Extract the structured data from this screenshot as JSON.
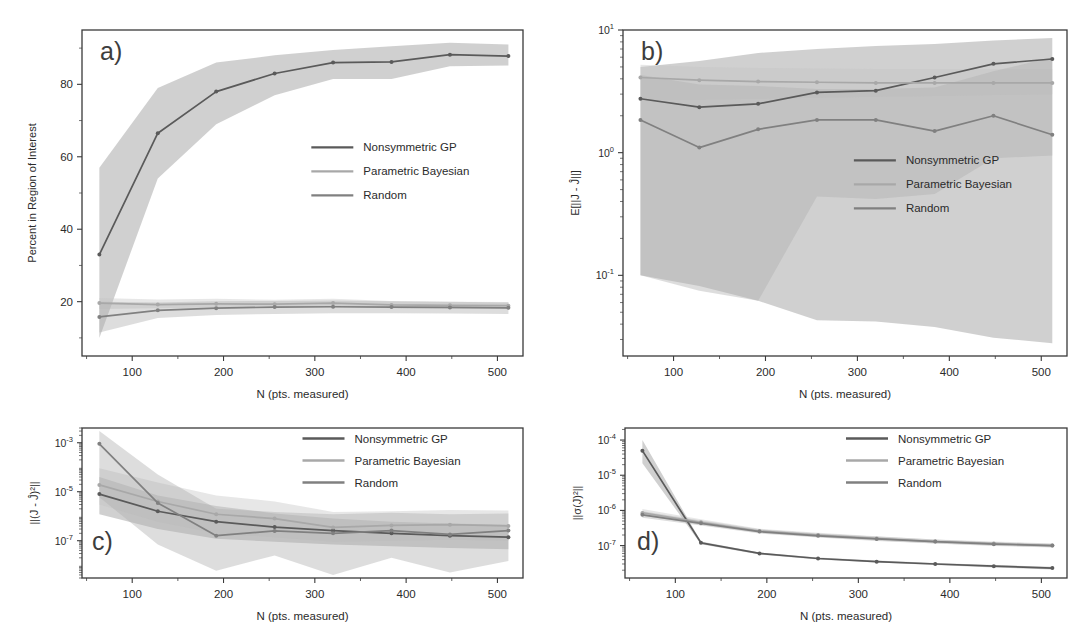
{
  "figure": {
    "xlabel": "N (pts. measured)",
    "series_names": [
      "Nonsymmetric GP",
      "Parametric Bayesian",
      "Random"
    ],
    "colors": {
      "nonsymmetric_gp": "#5a5a5a",
      "parametric_bayesian": "#a8a8a8",
      "random": "#808080",
      "band_gp": "#8f8f8f",
      "band_pb": "#c4c4c4",
      "band_rand": "#adadad",
      "axis": "#3a3a3a",
      "text": "#2b2b2b"
    }
  },
  "chart_data": [
    {
      "id": "a",
      "panel_label": "a)",
      "type": "line",
      "title": "",
      "xlabel": "N (pts. measured)",
      "ylabel": "Percent in Region of Interest",
      "xscale": "linear",
      "yscale": "linear",
      "xlim": [
        45,
        528
      ],
      "ylim": [
        5,
        95
      ],
      "xticks": [
        100,
        200,
        300,
        400,
        500
      ],
      "yticks": [
        20,
        40,
        60,
        80
      ],
      "grid": false,
      "legend_position": "center-right",
      "x": [
        64,
        128,
        192,
        256,
        320,
        384,
        448,
        512
      ],
      "series": [
        {
          "name": "Nonsymmetric GP",
          "values": [
            33.0,
            66.5,
            78.0,
            83.0,
            86.0,
            86.2,
            88.2,
            87.8
          ],
          "band_low": [
            10.0,
            54.0,
            69.0,
            77.0,
            81.5,
            81.5,
            85.0,
            85.2
          ],
          "band_high": [
            57.0,
            79.0,
            86.0,
            88.0,
            89.5,
            90.5,
            91.5,
            91.0
          ]
        },
        {
          "name": "Parametric Bayesian",
          "values": [
            19.6,
            19.2,
            19.4,
            19.3,
            19.6,
            19.1,
            19.0,
            18.9
          ],
          "band_low": [
            18.0,
            18.2,
            18.4,
            18.4,
            18.5,
            18.2,
            18.0,
            18.0
          ],
          "band_high": [
            21.0,
            20.6,
            20.8,
            20.5,
            20.8,
            20.2,
            20.0,
            19.9
          ]
        },
        {
          "name": "Random",
          "values": [
            15.8,
            17.6,
            18.2,
            18.5,
            18.6,
            18.5,
            18.4,
            18.3
          ],
          "band_low": [
            11.5,
            15.5,
            16.3,
            16.6,
            16.8,
            16.8,
            16.7,
            16.6
          ],
          "band_high": [
            20.0,
            19.8,
            20.1,
            20.2,
            20.3,
            20.1,
            20.0,
            19.8
          ]
        }
      ]
    },
    {
      "id": "b",
      "panel_label": "b)",
      "type": "line",
      "title": "",
      "xlabel": "N (pts. measured)",
      "ylabel": "E[||J - Ĵ||]",
      "xscale": "linear",
      "yscale": "log",
      "xlim": [
        45,
        528
      ],
      "ylim": [
        0.022,
        10
      ],
      "xticks": [
        100,
        200,
        300,
        400,
        500
      ],
      "yticks": [
        0.1,
        1,
        10
      ],
      "ytick_labels": [
        "10^-1",
        "10^0",
        "10^1"
      ],
      "grid": false,
      "legend_position": "center-right",
      "x": [
        64,
        128,
        192,
        256,
        320,
        384,
        448,
        512
      ],
      "series": [
        {
          "name": "Nonsymmetric GP",
          "values": [
            2.75,
            2.35,
            2.5,
            3.1,
            3.2,
            4.1,
            5.3,
            5.8
          ],
          "band_low": [
            0.1,
            0.082,
            0.062,
            0.043,
            0.042,
            0.038,
            0.031,
            0.028
          ],
          "band_high": [
            5.0,
            5.6,
            6.5,
            7.0,
            7.4,
            7.7,
            8.2,
            8.6
          ]
        },
        {
          "name": "Parametric Bayesian",
          "values": [
            4.1,
            3.9,
            3.8,
            3.75,
            3.7,
            3.7,
            3.7,
            3.7
          ],
          "band_low": [
            2.7,
            2.7,
            2.75,
            2.8,
            2.85,
            2.9,
            2.95,
            3.0
          ],
          "band_high": [
            5.2,
            5.0,
            4.9,
            4.85,
            4.8,
            4.8,
            4.8,
            4.8
          ]
        },
        {
          "name": "Random",
          "values": [
            1.85,
            1.1,
            1.55,
            1.85,
            1.85,
            1.5,
            2.0,
            1.4
          ],
          "band_low": [
            0.1,
            0.075,
            0.062,
            0.44,
            0.42,
            0.46,
            0.9,
            0.95
          ],
          "band_high": [
            4.3,
            3.6,
            3.5,
            3.3,
            3.3,
            3.4,
            4.6,
            6.0
          ]
        }
      ]
    },
    {
      "id": "c",
      "panel_label": "c)",
      "type": "line",
      "title": "",
      "xlabel": "N (pts. measured)",
      "ylabel": "||(J - Ĵ)²||",
      "xscale": "linear",
      "yscale": "log",
      "xlim": [
        45,
        528
      ],
      "ylim": [
        3e-09,
        0.004
      ],
      "xticks": [
        100,
        200,
        300,
        400,
        500
      ],
      "yticks": [
        0.001,
        1e-05,
        1e-07
      ],
      "ytick_labels": [
        "10^-3",
        "10^-5",
        "10^-7"
      ],
      "grid": false,
      "legend_position": "top-right",
      "x": [
        64,
        128,
        192,
        256,
        320,
        384,
        448,
        512
      ],
      "series": [
        {
          "name": "Nonsymmetric GP",
          "values": [
            8e-06,
            1.6e-06,
            6e-07,
            3.6e-07,
            2.6e-07,
            2e-07,
            1.6e-07,
            1.4e-07
          ],
          "band_low": [
            1.2e-06,
            3e-07,
            1.2e-07,
            9e-08,
            7e-08,
            6e-08,
            5e-08,
            4.5e-08
          ],
          "band_high": [
            4e-05,
            7e-06,
            2.6e-06,
            1.3e-06,
            8e-07,
            6e-07,
            5e-07,
            4.5e-07
          ]
        },
        {
          "name": "Parametric Bayesian",
          "values": [
            1.9e-05,
            4e-06,
            1.2e-06,
            8e-07,
            3.5e-07,
            4.2e-07,
            4.5e-07,
            4e-07
          ],
          "band_low": [
            3e-06,
            6e-07,
            2e-07,
            1.4e-07,
            9e-08,
            1e-07,
            1.1e-07,
            1e-07
          ],
          "band_high": [
            9e-05,
            2.4e-05,
            7e-06,
            4e-06,
            1.5e-06,
            1.6e-06,
            1.8e-06,
            1.7e-06
          ]
        },
        {
          "name": "Random",
          "values": [
            0.0009,
            3.5e-06,
            1.6e-07,
            2.5e-07,
            2e-07,
            2.6e-07,
            1.8e-07,
            2.6e-07
          ],
          "band_low": [
            6e-06,
            7e-08,
            6e-09,
            2.5e-08,
            4e-09,
            2e-08,
            5e-09,
            1.5e-08
          ],
          "band_high": [
            0.003,
            5e-05,
            2e-06,
            1.5e-06,
            1.2e-06,
            1.4e-06,
            1.2e-06,
            1.3e-06
          ]
        }
      ]
    },
    {
      "id": "d",
      "panel_label": "d)",
      "type": "line",
      "title": "",
      "xlabel": "N (pts. measured)",
      "ylabel": "||σ(J)²||",
      "xscale": "linear",
      "yscale": "log",
      "xlim": [
        45,
        528
      ],
      "ylim": [
        1.2e-08,
        0.00022
      ],
      "xticks": [
        100,
        200,
        300,
        400,
        500
      ],
      "yticks": [
        0.0001,
        1e-05,
        1e-06,
        1e-07
      ],
      "ytick_labels": [
        "10^-4",
        "10^-5",
        "10^-6",
        "10^-7"
      ],
      "grid": false,
      "legend_position": "top-right",
      "x": [
        64,
        128,
        192,
        256,
        320,
        384,
        448,
        512
      ],
      "series": [
        {
          "name": "Nonsymmetric GP",
          "values": [
            5e-05,
            1.2e-07,
            6e-08,
            4.3e-08,
            3.5e-08,
            3e-08,
            2.6e-08,
            2.3e-08
          ],
          "band_low": [
            2.2e-05,
            1.1e-07,
            5.6e-08,
            4e-08,
            3.3e-08,
            2.8e-08,
            2.4e-08,
            2.1e-08
          ],
          "band_high": [
            0.0001,
            1.3e-07,
            6.4e-08,
            4.6e-08,
            3.8e-08,
            3.2e-08,
            2.8e-08,
            2.5e-08
          ]
        },
        {
          "name": "Parametric Bayesian",
          "values": [
            8.5e-07,
            4.6e-07,
            2.6e-07,
            2e-07,
            1.6e-07,
            1.3e-07,
            1.15e-07,
            1e-07
          ],
          "band_low": [
            7e-07,
            3.9e-07,
            2.3e-07,
            1.75e-07,
            1.4e-07,
            1.15e-07,
            1e-07,
            9e-08
          ],
          "band_high": [
            1.1e-06,
            5.6e-07,
            3e-07,
            2.3e-07,
            1.85e-07,
            1.5e-07,
            1.3e-07,
            1.15e-07
          ]
        },
        {
          "name": "Random",
          "values": [
            7.5e-07,
            4.3e-07,
            2.5e-07,
            1.9e-07,
            1.55e-07,
            1.3e-07,
            1.1e-07,
            1e-07
          ],
          "band_low": [
            6.2e-07,
            3.7e-07,
            2.2e-07,
            1.7e-07,
            1.35e-07,
            1.15e-07,
            9.8e-08,
            8.8e-08
          ],
          "band_high": [
            9.5e-07,
            5.2e-07,
            2.9e-07,
            2.2e-07,
            1.8e-07,
            1.5e-07,
            1.25e-07,
            1.12e-07
          ]
        }
      ]
    }
  ]
}
